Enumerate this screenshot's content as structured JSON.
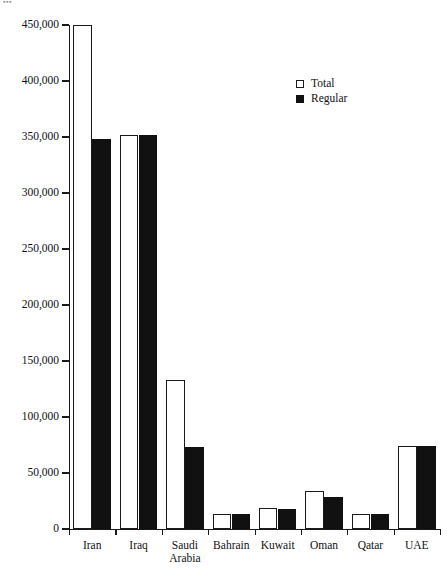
{
  "page_artifact": "▪▪▪",
  "legend": {
    "position": "top-right-inside",
    "entries": [
      {
        "label": "Total",
        "swatch": "open-square-icon"
      },
      {
        "label": "Regular",
        "swatch": "filled-square-icon"
      }
    ]
  },
  "yaxis": {
    "ticks": [
      "450,000",
      "400,000",
      "350,000",
      "300,000",
      "250,000",
      "200,000",
      "150,000",
      "100,000",
      "50,000",
      "0"
    ],
    "tick_values": [
      450000,
      400000,
      350000,
      300000,
      250000,
      200000,
      150000,
      100000,
      50000,
      0
    ],
    "min": 0,
    "max": 450000,
    "step": 50000
  },
  "chart_data": {
    "type": "bar",
    "title": "",
    "subtitle": "",
    "xlabel": "",
    "ylabel": "",
    "ylim": [
      0,
      450000
    ],
    "ytick_step": 50000,
    "grid": false,
    "legend_position": "upper right",
    "categories": [
      "Iran",
      "Iraq",
      "Saudi\nArabia",
      "Bahrain",
      "Kuwait",
      "Oman",
      "Qatar",
      "UAE"
    ],
    "series": [
      {
        "name": "Total",
        "color": "#ffffff",
        "edge_color": "#1a1a1a",
        "values": [
          450000,
          352000,
          133000,
          13000,
          19000,
          34000,
          13000,
          74000
        ]
      },
      {
        "name": "Regular",
        "color": "#111111",
        "edge_color": "#111111",
        "values": [
          348000,
          352000,
          73000,
          13000,
          18000,
          29000,
          13500,
          74000
        ]
      }
    ]
  },
  "colors": {
    "axis": "#1a1a1a",
    "text": "#111111",
    "background": "#ffffff",
    "total_fill": "#ffffff",
    "regular_fill": "#111111"
  }
}
